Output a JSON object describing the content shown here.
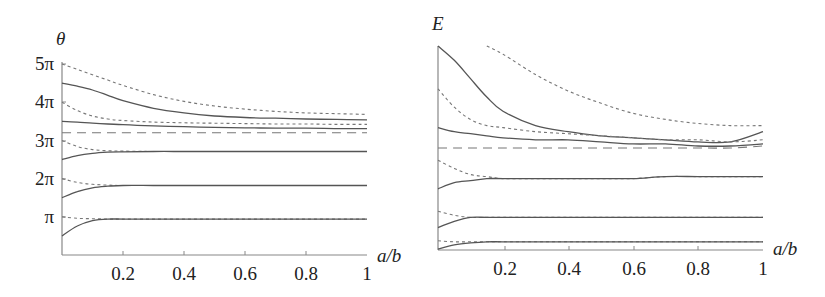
{
  "chart_data": [
    {
      "type": "line",
      "title": "",
      "ylabel": "θ",
      "xlabel": "a/b",
      "xlim": [
        0,
        1
      ],
      "ylim_pi_units": [
        0,
        5
      ],
      "x_ticks": [
        "0.2",
        "0.4",
        "0.6",
        "0.8",
        "1"
      ],
      "y_ticks": [
        "π",
        "2π",
        "3π",
        "4π",
        "5π"
      ],
      "grid": false,
      "x": [
        0,
        0.05,
        0.1,
        0.15,
        0.2,
        0.3,
        0.4,
        0.5,
        0.6,
        0.7,
        0.8,
        0.9,
        1.0
      ],
      "series": [
        {
          "name": "dashed-1",
          "style": "dashed",
          "values_pi": [
            5.0,
            4.86,
            4.72,
            4.58,
            4.44,
            4.2,
            4.02,
            3.9,
            3.82,
            3.76,
            3.72,
            3.7,
            3.68
          ]
        },
        {
          "name": "solid-1",
          "style": "solid",
          "values_pi": [
            4.5,
            4.42,
            4.32,
            4.18,
            4.04,
            3.84,
            3.72,
            3.64,
            3.6,
            3.58,
            3.56,
            3.55,
            3.54
          ]
        },
        {
          "name": "dashed-2",
          "style": "dashed",
          "values_pi": [
            4.0,
            3.78,
            3.64,
            3.56,
            3.52,
            3.48,
            3.46,
            3.45,
            3.44,
            3.43,
            3.43,
            3.42,
            3.42
          ]
        },
        {
          "name": "solid-2",
          "style": "solid",
          "values_pi": [
            3.5,
            3.48,
            3.45,
            3.43,
            3.41,
            3.38,
            3.36,
            3.34,
            3.33,
            3.32,
            3.32,
            3.31,
            3.31
          ]
        },
        {
          "name": "asymptote",
          "style": "long-dashed",
          "values_pi": [
            3.2,
            3.2,
            3.2,
            3.2,
            3.2,
            3.2,
            3.2,
            3.2,
            3.2,
            3.2,
            3.2,
            3.2,
            3.2
          ]
        },
        {
          "name": "dashed-3",
          "style": "dashed",
          "values_pi": [
            3.0,
            2.84,
            2.76,
            2.73,
            2.72,
            2.71,
            2.71,
            2.71,
            2.71,
            2.71,
            2.71,
            2.71,
            2.71
          ]
        },
        {
          "name": "solid-3",
          "style": "solid",
          "values_pi": [
            2.5,
            2.6,
            2.66,
            2.69,
            2.7,
            2.71,
            2.71,
            2.71,
            2.71,
            2.71,
            2.71,
            2.71,
            2.71
          ]
        },
        {
          "name": "dashed-4",
          "style": "dashed",
          "values_pi": [
            2.0,
            1.9,
            1.85,
            1.83,
            1.82,
            1.82,
            1.82,
            1.82,
            1.82,
            1.82,
            1.82,
            1.82,
            1.82
          ]
        },
        {
          "name": "solid-4",
          "style": "solid",
          "values_pi": [
            1.5,
            1.66,
            1.76,
            1.8,
            1.82,
            1.82,
            1.82,
            1.82,
            1.82,
            1.82,
            1.82,
            1.82,
            1.82
          ]
        },
        {
          "name": "dashed-5",
          "style": "dashed",
          "values_pi": [
            1.0,
            0.96,
            0.95,
            0.94,
            0.94,
            0.94,
            0.94,
            0.94,
            0.94,
            0.94,
            0.94,
            0.94,
            0.94
          ]
        },
        {
          "name": "solid-5",
          "style": "solid",
          "values_pi": [
            0.5,
            0.76,
            0.9,
            0.94,
            0.94,
            0.94,
            0.94,
            0.94,
            0.94,
            0.94,
            0.94,
            0.94,
            0.94
          ]
        }
      ]
    },
    {
      "type": "line",
      "title": "",
      "ylabel": "E",
      "xlabel": "a/b",
      "xlim": [
        0,
        1
      ],
      "ylim": [
        0,
        1
      ],
      "y_ticks": [],
      "x_ticks": [
        "0.2",
        "0.4",
        "0.6",
        "0.8",
        "1"
      ],
      "grid": false,
      "note": "E values normalized: 0 = bottom axis, 1 = top of vertical axis",
      "x": [
        0,
        0.05,
        0.1,
        0.15,
        0.2,
        0.3,
        0.4,
        0.5,
        0.6,
        0.7,
        0.8,
        0.9,
        1.0
      ],
      "series": [
        {
          "name": "dashed-1",
          "style": "dashed",
          "values": [
            null,
            null,
            null,
            1.0,
            0.96,
            0.86,
            0.78,
            0.72,
            0.67,
            0.64,
            0.62,
            0.61,
            0.61
          ]
        },
        {
          "name": "solid-1",
          "style": "solid",
          "values": [
            1.0,
            0.93,
            0.84,
            0.75,
            0.68,
            0.61,
            0.58,
            0.56,
            0.55,
            0.54,
            0.53,
            0.53,
            0.58
          ]
        },
        {
          "name": "dashed-2",
          "style": "dashed",
          "values": [
            0.79,
            0.7,
            0.64,
            0.61,
            0.6,
            0.58,
            0.57,
            0.56,
            0.55,
            0.54,
            0.54,
            0.53,
            0.54
          ]
        },
        {
          "name": "solid-2",
          "style": "solid",
          "values": [
            0.6,
            0.58,
            0.57,
            0.56,
            0.55,
            0.54,
            0.54,
            0.53,
            0.52,
            0.52,
            0.51,
            0.51,
            0.52
          ]
        },
        {
          "name": "asymptote",
          "style": "long-dashed",
          "values": [
            0.5,
            0.5,
            0.5,
            0.5,
            0.5,
            0.5,
            0.5,
            0.5,
            0.5,
            0.5,
            0.5,
            0.5,
            0.51
          ]
        },
        {
          "name": "dashed-3",
          "style": "dashed",
          "values": [
            0.44,
            0.4,
            0.37,
            0.36,
            0.35,
            0.35,
            0.35,
            0.35,
            0.35,
            0.36,
            0.36,
            0.36,
            0.36
          ]
        },
        {
          "name": "solid-3",
          "style": "solid",
          "values": [
            0.3,
            0.33,
            0.34,
            0.35,
            0.35,
            0.35,
            0.35,
            0.35,
            0.35,
            0.36,
            0.36,
            0.36,
            0.36
          ]
        },
        {
          "name": "dashed-4",
          "style": "dashed",
          "values": [
            0.19,
            0.17,
            0.16,
            0.16,
            0.16,
            0.16,
            0.16,
            0.16,
            0.16,
            0.16,
            0.16,
            0.16,
            0.16
          ]
        },
        {
          "name": "solid-4",
          "style": "solid",
          "values": [
            0.11,
            0.14,
            0.16,
            0.16,
            0.16,
            0.16,
            0.16,
            0.16,
            0.16,
            0.16,
            0.16,
            0.16,
            0.16
          ]
        },
        {
          "name": "dashed-5",
          "style": "dashed",
          "values": [
            0.045,
            0.04,
            0.04,
            0.04,
            0.04,
            0.04,
            0.04,
            0.04,
            0.04,
            0.04,
            0.04,
            0.04,
            0.04
          ]
        },
        {
          "name": "solid-5",
          "style": "solid",
          "values": [
            0.005,
            0.025,
            0.035,
            0.04,
            0.04,
            0.04,
            0.04,
            0.04,
            0.04,
            0.04,
            0.04,
            0.04,
            0.04
          ]
        }
      ]
    }
  ],
  "left_panel": {
    "ylabel": "θ",
    "xlabel": "a/b",
    "y_tick_labels": [
      "π",
      "2π",
      "3π",
      "4π",
      "5π"
    ],
    "x_tick_labels": [
      "0.2",
      "0.4",
      "0.6",
      "0.8",
      "1"
    ]
  },
  "right_panel": {
    "ylabel": "E",
    "xlabel": "a/b",
    "x_tick_labels": [
      "0.2",
      "0.4",
      "0.6",
      "0.8",
      "1"
    ]
  }
}
